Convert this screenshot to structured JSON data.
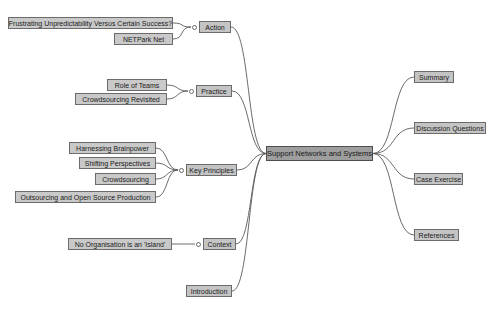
{
  "mindmap": {
    "root": {
      "label": "Support Networks and Systems",
      "x": 266,
      "y": 146,
      "w": 107,
      "h": 15
    },
    "branches_left": [
      {
        "label": "Action",
        "x": 199,
        "y": 21,
        "w": 32,
        "h": 12,
        "toggle": true
      },
      {
        "label": "Practice",
        "x": 196,
        "y": 85,
        "w": 36,
        "h": 12,
        "toggle": true
      },
      {
        "label": "Key Principles",
        "x": 186,
        "y": 164,
        "w": 51,
        "h": 12,
        "toggle": true
      },
      {
        "label": "Context",
        "x": 203,
        "y": 238,
        "w": 33,
        "h": 12,
        "toggle": true
      },
      {
        "label": "Introduction",
        "x": 186,
        "y": 285,
        "w": 46,
        "h": 12,
        "toggle": false
      }
    ],
    "branches_right": [
      {
        "label": "Summary",
        "x": 414,
        "y": 71,
        "w": 40,
        "h": 12
      },
      {
        "label": "Discussion Questions",
        "x": 414,
        "y": 122,
        "w": 72,
        "h": 12
      },
      {
        "label": "Case Exercise",
        "x": 414,
        "y": 173,
        "w": 49,
        "h": 12
      },
      {
        "label": "References",
        "x": 414,
        "y": 229,
        "w": 45,
        "h": 12
      }
    ],
    "leaves": [
      {
        "label": "Frustrating Unpredictability Versus Certain Success?",
        "x": 8,
        "y": 17,
        "w": 165,
        "h": 12,
        "parent": "Action"
      },
      {
        "label": "NETPark Net",
        "x": 114,
        "y": 33,
        "w": 59,
        "h": 12,
        "parent": "Action"
      },
      {
        "label": "Role of Teams",
        "x": 107,
        "y": 79,
        "w": 60,
        "h": 12,
        "parent": "Practice"
      },
      {
        "label": "Crowdsourcing Revisited",
        "x": 75,
        "y": 93,
        "w": 92,
        "h": 12,
        "parent": "Practice"
      },
      {
        "label": "Harnessing Brainpower",
        "x": 69,
        "y": 142,
        "w": 87,
        "h": 12,
        "parent": "Key Principles"
      },
      {
        "label": "Shifting Perspectives",
        "x": 79,
        "y": 157,
        "w": 77,
        "h": 12,
        "parent": "Key Principles"
      },
      {
        "label": "Crowdsourcing",
        "x": 95,
        "y": 173,
        "w": 61,
        "h": 12,
        "parent": "Key Principles"
      },
      {
        "label": "Outsourcing and Open Source Production",
        "x": 15,
        "y": 191,
        "w": 141,
        "h": 12,
        "parent": "Key Principles"
      },
      {
        "label": "No Organisation is an 'Island'",
        "x": 68,
        "y": 238,
        "w": 104,
        "h": 12,
        "parent": "Context"
      }
    ],
    "colors": {
      "background": "#ffffff",
      "node_fill": "#bdbdbd",
      "root_fill": "#9e9e9e",
      "node_border": "#6b6b6b",
      "edge": "#5a5a5a",
      "text": "#1a1a1a"
    }
  }
}
